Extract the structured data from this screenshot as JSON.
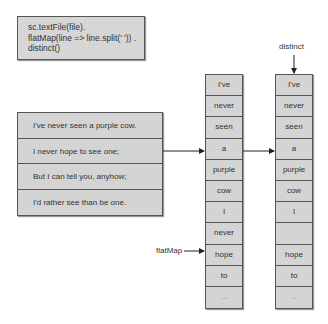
{
  "code": {
    "lines": [
      "sc.textFile(file).",
      "flatMap(line => line.split(' ')) .",
      "distinct()"
    ]
  },
  "input_lines": [
    "I've never seen a purple cow.",
    "I never hope to see one;",
    "But I can tell you, anyhow;",
    "I'd rather see than be one."
  ],
  "flatmap_column": [
    "I've",
    "never",
    "seen",
    "a",
    "purple",
    "cow",
    "I",
    "never",
    "hope",
    "to",
    "..."
  ],
  "distinct_column": [
    "I've",
    "never",
    "seen",
    "a",
    "purple",
    "cow",
    "I",
    "",
    "hope",
    "to",
    "..."
  ],
  "labels": {
    "flatmap": "flatMap",
    "distinct": "distinct"
  }
}
